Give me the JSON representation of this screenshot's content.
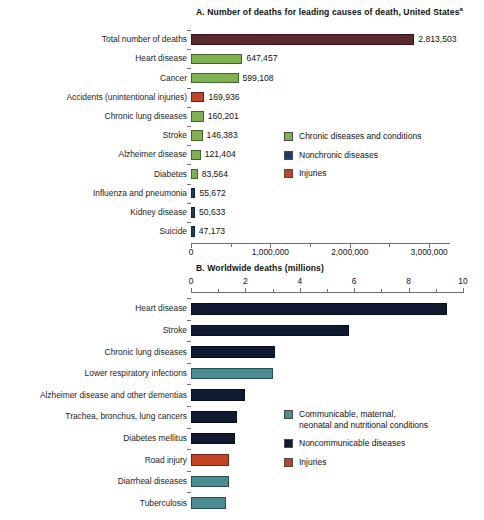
{
  "chart_data": [
    {
      "type": "bar",
      "orientation": "horizontal",
      "id": "panel-a",
      "title": "A. Number of deaths for leading causes of death, United States",
      "title_superscript": "a",
      "xlabel": "",
      "ylabel": "",
      "xlim": [
        0,
        3250000
      ],
      "axis_position": "bottom",
      "grid": false,
      "ticks": [
        {
          "value": 0,
          "label": "0",
          "major": true
        },
        {
          "value": 500000,
          "label": "",
          "major": false
        },
        {
          "value": 1000000,
          "label": "1,000,000",
          "major": true
        },
        {
          "value": 1500000,
          "label": "",
          "major": false
        },
        {
          "value": 2000000,
          "label": "2,000,000",
          "major": true
        },
        {
          "value": 2500000,
          "label": "",
          "major": false
        },
        {
          "value": 3000000,
          "label": "3,000,000",
          "major": true
        }
      ],
      "categories": [
        "Total number of deaths",
        "Heart disease",
        "Cancer",
        "Accidents (unintentional injuries)",
        "Chronic lung diseases",
        "Stroke",
        "Alzheimer disease",
        "Diabetes",
        "Influenza and pneumonia",
        "Kidney disease",
        "Suicide"
      ],
      "values": [
        2813503,
        647457,
        599108,
        169936,
        160201,
        146383,
        121404,
        83564,
        55672,
        50633,
        47173
      ],
      "value_labels": [
        "2,813,503",
        "647,457",
        "599,108",
        "169,936",
        "160,201",
        "146,383",
        "121,404",
        "83,564",
        "55,672",
        "50,633",
        "47,173"
      ],
      "colors": [
        "#5c2833",
        "#7fb350",
        "#7fb350",
        "#c24424",
        "#7fb350",
        "#7fb350",
        "#7fb350",
        "#7fb350",
        "#1f3b6e",
        "#1f3b6e",
        "#1f3b6e"
      ],
      "legend_position": "right-middle",
      "legend": [
        {
          "label": "Chronic diseases and conditions",
          "color": "#7fb350"
        },
        {
          "label": "Nonchronic diseases",
          "color": "#1f3b6e"
        },
        {
          "label": "Injuries",
          "color": "#c24424"
        }
      ]
    },
    {
      "type": "bar",
      "orientation": "horizontal",
      "id": "panel-b",
      "title": "B. Worldwide deaths (millions)",
      "title_superscript": "",
      "xlabel": "",
      "ylabel": "",
      "xlim": [
        0,
        10
      ],
      "axis_position": "top",
      "grid": false,
      "ticks": [
        {
          "value": 0,
          "label": "0",
          "major": true
        },
        {
          "value": 1,
          "label": "",
          "major": false
        },
        {
          "value": 2,
          "label": "2",
          "major": true
        },
        {
          "value": 3,
          "label": "",
          "major": false
        },
        {
          "value": 4,
          "label": "4",
          "major": true
        },
        {
          "value": 5,
          "label": "",
          "major": false
        },
        {
          "value": 6,
          "label": "6",
          "major": true
        },
        {
          "value": 7,
          "label": "",
          "major": false
        },
        {
          "value": 8,
          "label": "8",
          "major": true
        },
        {
          "value": 9,
          "label": "",
          "major": false
        },
        {
          "value": 10,
          "label": "10",
          "major": true
        }
      ],
      "categories": [
        "Heart disease",
        "Stroke",
        "Chronic lung diseases",
        "Lower respiratory infections",
        "Alzheimer disease and other dementias",
        "Trachea, bronchus, lung cancers",
        "Diabetes mellitus",
        "Road injury",
        "Diarrheal diseases",
        "Tuberculosis"
      ],
      "values": [
        9.4,
        5.8,
        3.1,
        3.0,
        2.0,
        1.7,
        1.6,
        1.4,
        1.4,
        1.3
      ],
      "value_labels": [
        "",
        "",
        "",
        "",
        "",
        "",
        "",
        "",
        "",
        ""
      ],
      "colors": [
        "#111a33",
        "#111a33",
        "#111a33",
        "#4a8e94",
        "#111a33",
        "#111a33",
        "#111a33",
        "#c24424",
        "#4a8e94",
        "#4a8e94"
      ],
      "legend_position": "right-lower",
      "legend": [
        {
          "label": "Communicable, maternal,\nneonatal and nutritional conditions",
          "color": "#4a8e94"
        },
        {
          "label": "Noncommunicable diseases",
          "color": "#111a33"
        },
        {
          "label": "Injuries",
          "color": "#c24424"
        }
      ]
    }
  ]
}
